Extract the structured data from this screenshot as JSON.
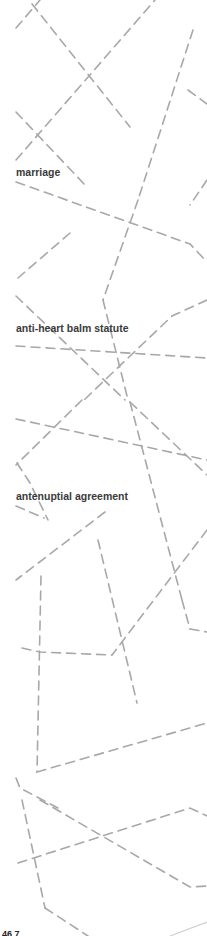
{
  "margin_terms": [
    {
      "label": "marriage",
      "top": 166
    },
    {
      "label": "anti-heart balm statute",
      "top": 322
    },
    {
      "label": "antenuptial agreement",
      "top": 490
    }
  ],
  "page_number": "46 7",
  "colors": {
    "dash_line": "#a8a8a8",
    "text": "#3a3a3a"
  }
}
